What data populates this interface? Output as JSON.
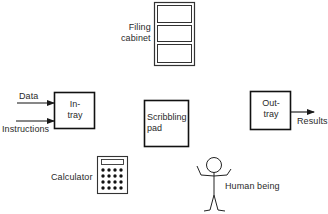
{
  "diagram": {
    "components": {
      "filing_cabinet": {
        "label": "Filing cabinet",
        "label_lines": [
          "Filing",
          "cabinet"
        ],
        "icon": "filing-cabinet-icon"
      },
      "in_tray": {
        "label_lines": [
          "In-",
          "tray"
        ]
      },
      "scribbling_pad": {
        "label_lines": [
          "Scribbling",
          "pad"
        ]
      },
      "out_tray": {
        "label_lines": [
          "Out-",
          "tray"
        ]
      },
      "calculator": {
        "label": "Calculator",
        "icon": "calculator-icon"
      },
      "human_being": {
        "label": "Human being",
        "icon": "stick-figure-icon"
      }
    },
    "inputs": [
      {
        "label": "Data",
        "target": "in_tray"
      },
      {
        "label": "Instructions",
        "target": "in_tray"
      }
    ],
    "outputs": [
      {
        "label": "Results",
        "source": "out_tray"
      }
    ],
    "colors": {
      "stroke": "#1a1a1a",
      "background": "#ffffff"
    }
  }
}
